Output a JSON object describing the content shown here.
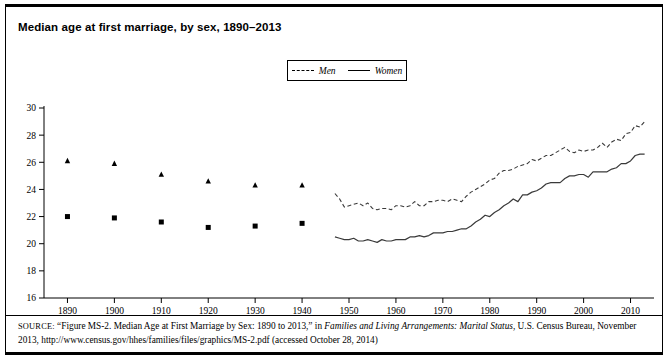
{
  "figure": {
    "title": "Median age at first marriage, by sex, 1890–2013",
    "source_label": "SOURCE:",
    "source_text_1": "“Figure MS-2. Median Age at First Marriage by Sex: 1890 to 2013,” in ",
    "source_italic_1": "Families and Living Arrangements: Marital Status",
    "source_text_2": ", U.S. Census Bureau, November 2013, http://www.census.gov/hhes/families/files/graphics/MS-2.pdf (accessed October 28, 2014)"
  },
  "legend": {
    "men_label": "Men",
    "women_label": "Women",
    "men_style": "dashed",
    "women_style": "solid",
    "position": "top-center"
  },
  "colors": {
    "line": "#3a3a3a",
    "axis": "#000000",
    "marker": "#000000",
    "background": "#ffffff"
  },
  "chart_data": {
    "type": "line",
    "title": "Median age at first marriage, by sex, 1890–2013",
    "xlabel": "",
    "ylabel": "",
    "xlim": [
      1885,
      2015
    ],
    "ylim": [
      16,
      30
    ],
    "ytick_labels": [
      "16",
      "18",
      "20",
      "22",
      "24",
      "26",
      "28",
      "30"
    ],
    "ytick_values": [
      16,
      18,
      20,
      22,
      24,
      26,
      28,
      30
    ],
    "xtick_labels": [
      "1890",
      "1900",
      "1910",
      "1920",
      "1930",
      "1940",
      "1950",
      "1960",
      "1970",
      "1980",
      "1990",
      "2000",
      "2010"
    ],
    "xtick_values": [
      1890,
      1900,
      1910,
      1920,
      1930,
      1940,
      1950,
      1960,
      1970,
      1980,
      1990,
      2000,
      2010
    ],
    "grid": false,
    "legend_position": "top-center",
    "series": [
      {
        "name": "Men",
        "style": "dashed",
        "marker": "triangle",
        "decade_points": {
          "x": [
            1890,
            1900,
            1910,
            1920,
            1930,
            1940
          ],
          "y": [
            26.1,
            25.9,
            25.1,
            24.6,
            24.3,
            24.3
          ]
        },
        "x": [
          1947,
          1948,
          1949,
          1950,
          1951,
          1952,
          1953,
          1954,
          1955,
          1956,
          1957,
          1958,
          1959,
          1960,
          1961,
          1962,
          1963,
          1964,
          1965,
          1966,
          1967,
          1968,
          1969,
          1970,
          1971,
          1972,
          1973,
          1974,
          1975,
          1976,
          1977,
          1978,
          1979,
          1980,
          1981,
          1982,
          1983,
          1984,
          1985,
          1986,
          1987,
          1988,
          1989,
          1990,
          1991,
          1992,
          1993,
          1994,
          1995,
          1996,
          1997,
          1998,
          1999,
          2000,
          2001,
          2002,
          2003,
          2004,
          2005,
          2006,
          2007,
          2008,
          2009,
          2010,
          2011,
          2012,
          2013
        ],
        "y": [
          23.7,
          23.3,
          22.7,
          22.8,
          22.9,
          23.0,
          22.8,
          23.0,
          22.6,
          22.5,
          22.6,
          22.6,
          22.5,
          22.8,
          22.8,
          22.7,
          22.8,
          23.1,
          22.8,
          22.8,
          23.1,
          23.1,
          23.2,
          23.2,
          23.1,
          23.3,
          23.2,
          23.1,
          23.5,
          23.8,
          24.0,
          24.2,
          24.4,
          24.7,
          24.8,
          25.2,
          25.4,
          25.4,
          25.5,
          25.7,
          25.8,
          25.9,
          26.2,
          26.1,
          26.3,
          26.5,
          26.5,
          26.7,
          26.9,
          27.1,
          26.8,
          26.7,
          26.9,
          26.8,
          26.9,
          26.9,
          27.1,
          27.4,
          27.1,
          27.5,
          27.7,
          27.6,
          28.1,
          28.2,
          28.7,
          28.6,
          29.0
        ]
      },
      {
        "name": "Women",
        "style": "solid",
        "marker": "square",
        "decade_points": {
          "x": [
            1890,
            1900,
            1910,
            1920,
            1930,
            1940
          ],
          "y": [
            22.0,
            21.9,
            21.6,
            21.2,
            21.3,
            21.5
          ]
        },
        "x": [
          1947,
          1948,
          1949,
          1950,
          1951,
          1952,
          1953,
          1954,
          1955,
          1956,
          1957,
          1958,
          1959,
          1960,
          1961,
          1962,
          1963,
          1964,
          1965,
          1966,
          1967,
          1968,
          1969,
          1970,
          1971,
          1972,
          1973,
          1974,
          1975,
          1976,
          1977,
          1978,
          1979,
          1980,
          1981,
          1982,
          1983,
          1984,
          1985,
          1986,
          1987,
          1988,
          1989,
          1990,
          1991,
          1992,
          1993,
          1994,
          1995,
          1996,
          1997,
          1998,
          1999,
          2000,
          2001,
          2002,
          2003,
          2004,
          2005,
          2006,
          2007,
          2008,
          2009,
          2010,
          2011,
          2012,
          2013
        ],
        "y": [
          20.5,
          20.4,
          20.3,
          20.3,
          20.4,
          20.2,
          20.2,
          20.3,
          20.2,
          20.1,
          20.3,
          20.2,
          20.2,
          20.3,
          20.3,
          20.3,
          20.5,
          20.5,
          20.6,
          20.5,
          20.6,
          20.8,
          20.8,
          20.8,
          20.9,
          20.9,
          21.0,
          21.1,
          21.1,
          21.3,
          21.6,
          21.8,
          22.1,
          22.0,
          22.3,
          22.5,
          22.8,
          23.0,
          23.3,
          23.1,
          23.6,
          23.6,
          23.8,
          23.9,
          24.1,
          24.4,
          24.5,
          24.5,
          24.5,
          24.8,
          25.0,
          25.0,
          25.1,
          25.1,
          24.9,
          25.3,
          25.3,
          25.3,
          25.3,
          25.5,
          25.6,
          25.9,
          25.9,
          26.1,
          26.5,
          26.6,
          26.6
        ]
      }
    ]
  }
}
